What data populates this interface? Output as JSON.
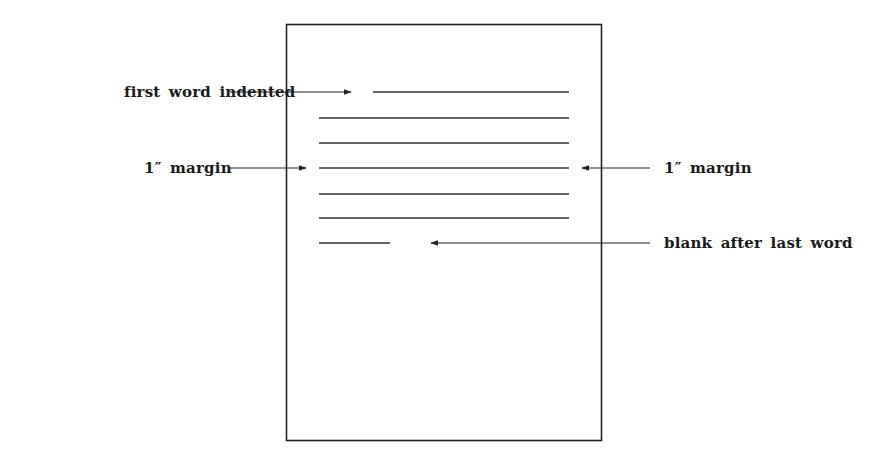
{
  "figure": {
    "type": "paragraph-format-diagram",
    "labels": {
      "first_word_indented": "first word indented",
      "left_margin": "1″ margin",
      "right_margin": "1″ margin",
      "blank_after_last_word": "blank after last word"
    },
    "page": {
      "border_color": "#222222",
      "x": 286,
      "y": 24,
      "width": 316,
      "height": 417
    },
    "text_lines": [
      {
        "x1": 373,
        "x2": 569,
        "y": 92,
        "role": "first-line-indented"
      },
      {
        "x1": 319,
        "x2": 569,
        "y": 118,
        "role": "body-line"
      },
      {
        "x1": 319,
        "x2": 569,
        "y": 143,
        "role": "body-line"
      },
      {
        "x1": 319,
        "x2": 569,
        "y": 168,
        "role": "body-line"
      },
      {
        "x1": 319,
        "x2": 569,
        "y": 194,
        "role": "body-line"
      },
      {
        "x1": 319,
        "x2": 569,
        "y": 218,
        "role": "body-line"
      },
      {
        "x1": 319,
        "x2": 390,
        "y": 243,
        "role": "last-line"
      }
    ],
    "arrows": [
      {
        "name": "first-word-arrow",
        "x1": 230,
        "x2": 350,
        "y": 92,
        "direction": "right"
      },
      {
        "name": "left-margin-arrow",
        "x1": 230,
        "x2": 305,
        "y": 168,
        "direction": "right"
      },
      {
        "name": "right-margin-arrow",
        "x1": 650,
        "x2": 583,
        "y": 168,
        "direction": "left"
      },
      {
        "name": "blank-after-last-word-arrow",
        "x1": 650,
        "x2": 432,
        "y": 243,
        "direction": "left"
      }
    ],
    "line_color": "#333333"
  }
}
